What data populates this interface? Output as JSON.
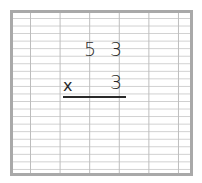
{
  "worksheet": {
    "problem": {
      "multiplicand": {
        "tens": "5",
        "ones": "3"
      },
      "operator": "x",
      "multiplier": {
        "ones": "3"
      }
    }
  }
}
